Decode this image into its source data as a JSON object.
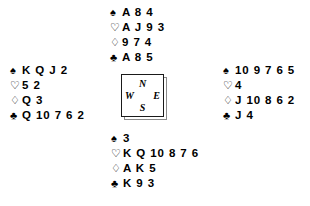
{
  "suits": {
    "spade": "♠",
    "heart": "♡",
    "diamond": "♢",
    "club": "♣"
  },
  "compass": {
    "north": "N",
    "east": "E",
    "south": "S",
    "west": "W"
  },
  "hands": {
    "north": {
      "label": "North",
      "spades": "A 8 4",
      "hearts": "A J 9 3",
      "diamonds": "9 7 4",
      "clubs": "A 8 5"
    },
    "west": {
      "label": "West",
      "spades": "K Q J 2",
      "hearts": "5 2",
      "diamonds": "Q 3",
      "clubs": "Q 10 7 6 2"
    },
    "east": {
      "label": "East",
      "spades": "10 9 7 6 5",
      "hearts": "4",
      "diamonds": "J 10 8 6 2",
      "clubs": "J 4"
    },
    "south": {
      "label": "South",
      "spades": "3",
      "hearts": "K Q 10 8 7 6",
      "diamonds": "A K 5",
      "clubs": "K 9 3"
    }
  }
}
